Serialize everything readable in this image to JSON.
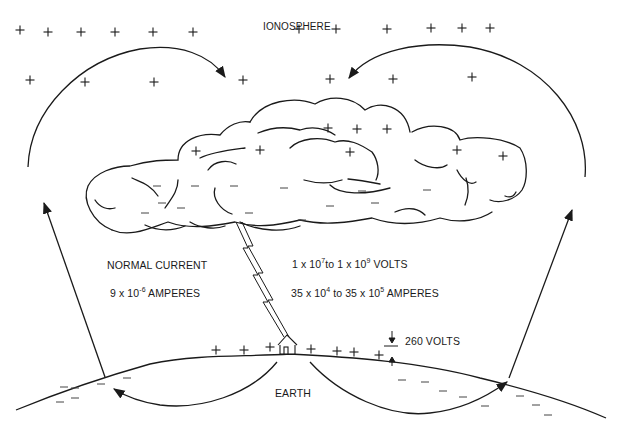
{
  "labels": {
    "ionosphere": "IONOSPHERE",
    "normal_current": "NORMAL CURRENT",
    "normal_amps_base": "9 x 10",
    "normal_amps_exp": "-6",
    "normal_amps_unit": " AMPERES",
    "volts_a_base": "1 x 10",
    "volts_a_exp": "7",
    "volts_mid": "to 1 x 10",
    "volts_b_exp": "9",
    "volts_unit": " VOLTS",
    "amps_a_base": "35 x 10",
    "amps_a_exp": "4",
    "amps_mid": " to 35 x 10",
    "amps_b_exp": "5",
    "amps_unit": " AMPERES",
    "ground_volts": "260 VOLTS",
    "earth": "EARTH"
  },
  "charges": {
    "ionosphere_plus": [
      [
        20,
        30
      ],
      [
        48,
        32
      ],
      [
        81,
        32
      ],
      [
        115,
        32
      ],
      [
        153,
        32
      ],
      [
        193,
        32
      ],
      [
        299,
        29
      ],
      [
        336,
        29
      ],
      [
        387,
        29
      ],
      [
        431,
        28
      ],
      [
        462,
        28
      ],
      [
        490,
        28
      ],
      [
        30,
        80
      ],
      [
        85,
        82
      ],
      [
        154,
        82
      ],
      [
        243,
        80
      ],
      [
        330,
        79
      ],
      [
        393,
        79
      ],
      [
        472,
        77
      ]
    ],
    "cloud_plus": [
      [
        196,
        151
      ],
      [
        260,
        150
      ],
      [
        328,
        128
      ],
      [
        357,
        129
      ],
      [
        387,
        129
      ],
      [
        350,
        152
      ],
      [
        457,
        150
      ],
      [
        503,
        156
      ]
    ],
    "cloud_minus": [
      [
        157,
        186
      ],
      [
        195,
        186
      ],
      [
        234,
        186
      ],
      [
        284,
        188
      ],
      [
        362,
        191
      ],
      [
        427,
        190
      ],
      [
        162,
        203
      ],
      [
        249,
        213
      ],
      [
        302,
        220
      ],
      [
        145,
        213
      ],
      [
        181,
        208
      ],
      [
        375,
        203
      ],
      [
        330,
        206
      ]
    ],
    "ground_plus": [
      [
        216,
        350
      ],
      [
        244,
        350
      ],
      [
        270,
        347
      ],
      [
        311,
        349
      ],
      [
        337,
        351
      ],
      [
        354,
        352
      ],
      [
        379,
        355
      ]
    ],
    "ground_minus": [
      [
        64,
        387
      ],
      [
        75,
        388
      ],
      [
        101,
        384
      ],
      [
        127,
        378
      ],
      [
        60,
        402
      ],
      [
        75,
        398
      ],
      [
        402,
        380
      ],
      [
        425,
        382
      ],
      [
        443,
        391
      ],
      [
        463,
        397
      ],
      [
        485,
        406
      ],
      [
        520,
        396
      ],
      [
        536,
        405
      ],
      [
        548,
        415
      ]
    ]
  },
  "colors": {
    "ink": "#1a1a1a",
    "background": "#ffffff"
  }
}
